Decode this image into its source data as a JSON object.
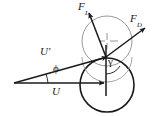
{
  "figure": {
    "type": "force-diagram",
    "background_color": "#ffffff",
    "ink_color": "#1a1a1a",
    "faint_color": "#8a8a8a",
    "labels": {
      "lift_force": {
        "symbol": "F",
        "subscript": "L"
      },
      "drag_force": {
        "symbol": "F",
        "subscript": "D"
      },
      "relative_velocity": {
        "symbol": "U'"
      },
      "velocity": {
        "symbol": "U"
      },
      "angle_phi": {
        "symbol": "ϕ"
      },
      "angle_gamma": {
        "symbol": "γ"
      }
    },
    "geometry": {
      "origin": {
        "x": 14,
        "y": 83
      },
      "contact_point": {
        "x": 106,
        "y": 57
      },
      "upper_circle": {
        "cx": 107,
        "cy": 41,
        "r": 25
      },
      "lower_circle": {
        "cx": 107,
        "cy": 85,
        "r": 27
      },
      "u_arrow_tip": {
        "x": 106,
        "y": 83
      },
      "uprime_arrow_tip": {
        "x": 109,
        "y": 56
      },
      "fd_arrow_tip": {
        "x": 146,
        "y": 27
      },
      "fl_arrow_tip": {
        "x": 88,
        "y": 11
      }
    }
  }
}
